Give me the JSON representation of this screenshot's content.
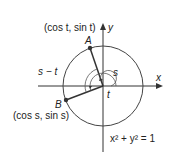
{
  "diagram": {
    "point_a": {
      "letter": "A",
      "coords": "(cos t, sin t)"
    },
    "point_b": {
      "letter": "B",
      "coords": "(cos s, sin s)"
    },
    "axes": {
      "x": "x",
      "y": "y"
    },
    "angles": {
      "s": "s",
      "t": "t",
      "s_minus_t": "s − t"
    },
    "equation": "x² + y² = 1",
    "colors": {
      "stroke": "#333333",
      "point": "#333333"
    }
  }
}
